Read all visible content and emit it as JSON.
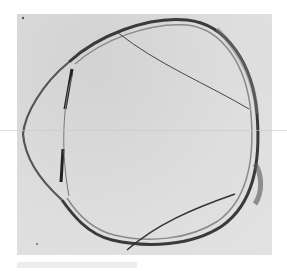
{
  "figure": {
    "colors": {
      "background": "#ffffff",
      "specimen_field": "#dcdcdc",
      "tissue_dark": "#2a2a2a",
      "tissue_mid": "#6a6a6a"
    }
  }
}
